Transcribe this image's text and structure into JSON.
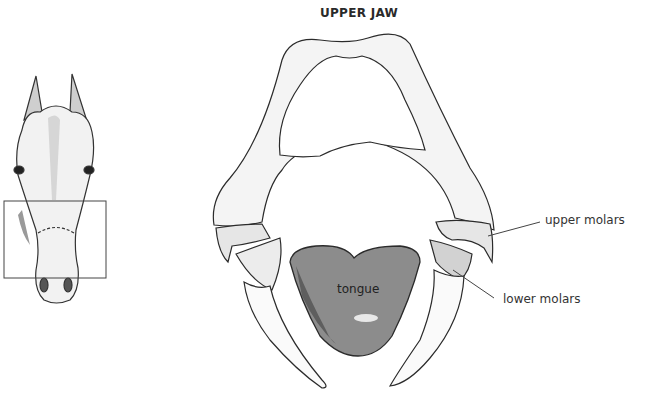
{
  "diagram": {
    "title": "UPPER JAW",
    "labels": {
      "tongue": "tongue",
      "upper_molars": "upper molars",
      "lower_molars": "lower molars"
    },
    "inset": {
      "subject": "horse-head-front-view",
      "highlight": "rectangle around muzzle / mouth region"
    },
    "colors": {
      "outline": "#2b2b2b",
      "bone_shade": "#d9d9d9",
      "tongue_fill": "#8a8a8a",
      "tongue_dark": "#5a5a5a",
      "background": "#ffffff"
    }
  }
}
